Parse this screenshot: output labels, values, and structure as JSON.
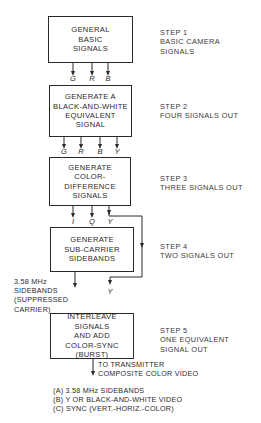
{
  "diagram": {
    "boxes": [
      {
        "id": "box-1",
        "lines": [
          "GENERAL",
          "BASIC",
          "SIGNALS"
        ]
      },
      {
        "id": "box-2",
        "lines": [
          "GENERATE A",
          "BLACK-AND-WHITE",
          "EQUIVALENT",
          "SIGNAL"
        ]
      },
      {
        "id": "box-3",
        "lines": [
          "GENERATE",
          "COLOR-",
          "DIFFERENCE",
          "SIGNALS"
        ]
      },
      {
        "id": "box-4",
        "lines": [
          "GENERATE",
          "SUB-CARRIER",
          "SIDEBANDS"
        ]
      },
      {
        "id": "box-5",
        "lines": [
          "INTERLEAVE",
          "SIGNALS",
          "AND ADD",
          "COLOR-SYNC",
          "(BURST)"
        ]
      }
    ],
    "steps": [
      {
        "title": "STEP 1",
        "lines": [
          "BASIC CAMERA",
          "SIGNALS"
        ]
      },
      {
        "title": "STEP 2",
        "lines": [
          "FOUR SIGNALS OUT"
        ]
      },
      {
        "title": "STEP 3",
        "lines": [
          "THREE SIGNALS OUT"
        ]
      },
      {
        "title": "STEP 4",
        "lines": [
          "TWO SIGNALS OUT"
        ]
      },
      {
        "title": "STEP 5",
        "lines": [
          "ONE EQUIVALENT",
          "SIGNAL OUT"
        ]
      }
    ],
    "signals": {
      "after_box_1": [
        "G",
        "R",
        "B"
      ],
      "after_box_2": [
        "G",
        "R",
        "B",
        "Y"
      ],
      "after_box_3": [
        "I",
        "Q",
        "Y"
      ],
      "bypass_y": "Y"
    },
    "sidebands_note": [
      "3.58 MHz",
      "SIDEBANDS",
      "(SUPPRESSED",
      "CARRIER)"
    ],
    "output_note": [
      "TO TRANSMITTER",
      "COMPOSITE COLOR VIDEO"
    ],
    "legend": [
      "(A)  3.58 MHz SIDEBANDS",
      "(B)  Y OR BLACK-AND-WHITE VIDEO",
      "(C)  SYNC (VERT.-HORIZ.-COLOR)"
    ],
    "colors": {
      "ink": "#2a2a2a",
      "background": "#ffffff"
    }
  }
}
